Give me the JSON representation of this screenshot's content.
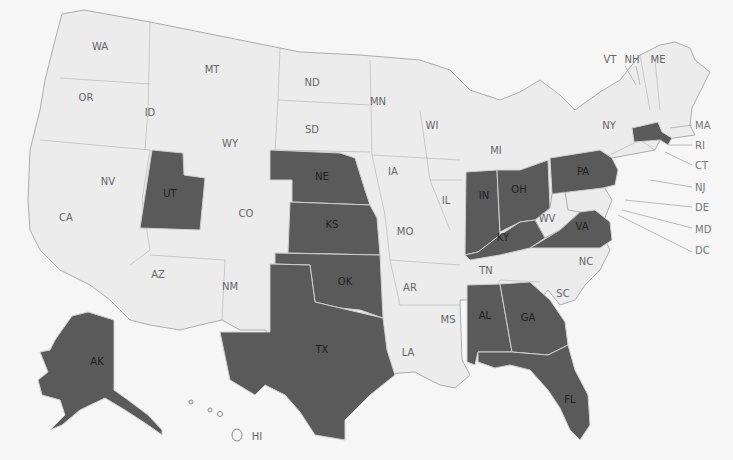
{
  "map": {
    "title": "United States map (shaded states)",
    "colors": {
      "background": "#f6f6f6",
      "unshaded_fill": "#ececec",
      "shaded_fill": "#5a5a5a",
      "border": "#9a9a9a"
    },
    "shaded_states": [
      "UT",
      "NE",
      "KS",
      "OK",
      "TX",
      "IN",
      "OH",
      "PA",
      "KY",
      "VA",
      "AL",
      "GA",
      "FL",
      "MA",
      "AK"
    ],
    "labels": {
      "WA": "WA",
      "OR": "OR",
      "CA": "CA",
      "NV": "NV",
      "ID": "ID",
      "MT": "MT",
      "WY": "WY",
      "UT": "UT",
      "CO": "CO",
      "AZ": "AZ",
      "NM": "NM",
      "ND": "ND",
      "SD": "SD",
      "NE": "NE",
      "KS": "KS",
      "OK": "OK",
      "TX": "TX",
      "MN": "MN",
      "IA": "IA",
      "MO": "MO",
      "AR": "AR",
      "LA": "LA",
      "WI": "WI",
      "IL": "IL",
      "MI": "MI",
      "IN": "IN",
      "OH": "OH",
      "KY": "KY",
      "TN": "TN",
      "MS": "MS",
      "AL": "AL",
      "GA": "GA",
      "FL": "FL",
      "SC": "SC",
      "NC": "NC",
      "VA": "VA",
      "WV": "WV",
      "PA": "PA",
      "NY": "NY",
      "VT": "VT",
      "NH": "NH",
      "ME": "ME",
      "MA": "MA",
      "RI": "RI",
      "CT": "CT",
      "NJ": "NJ",
      "DE": "DE",
      "MD": "MD",
      "DC": "DC",
      "AK": "AK",
      "HI": "HI"
    }
  }
}
